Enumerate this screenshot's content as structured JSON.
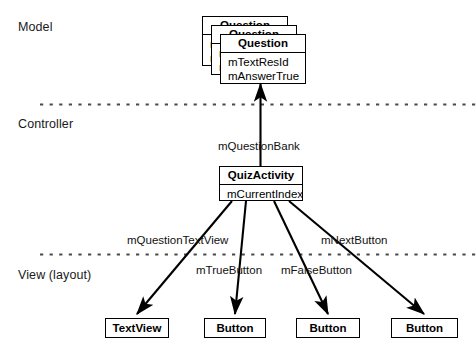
{
  "diagram": {
    "width": 476,
    "height": 347,
    "background": "#ffffff",
    "stroke_color": "#000000",
    "text_color": "#111111"
  },
  "tiers": [
    {
      "id": "model",
      "label": "Model",
      "divider_y": 104
    },
    {
      "id": "controller",
      "label": "Controller",
      "divider_y": 254
    },
    {
      "id": "view",
      "label": "View (layout)"
    }
  ],
  "model": {
    "question_class": {
      "name": "Question",
      "attributes": [
        "mTextResId",
        "mAnswerTrue"
      ],
      "stack_count": 3
    }
  },
  "controller": {
    "quiz_activity": {
      "name": "QuizActivity",
      "attributes": [
        "mCurrentIndex"
      ]
    },
    "association_label": "mQuestionBank"
  },
  "view": {
    "widgets": [
      {
        "id": "textview",
        "label": "TextView",
        "edge_label": "mQuestionTextView"
      },
      {
        "id": "true_button",
        "label": "Button",
        "edge_label": "mTrueButton"
      },
      {
        "id": "false_button",
        "label": "Button",
        "edge_label": "mFalseButton"
      },
      {
        "id": "next_button",
        "label": "Button",
        "edge_label": "mNextButton"
      }
    ]
  },
  "edges": [
    {
      "id": "quizactivity-to-question",
      "from": "QuizActivity",
      "to": "Question",
      "label": "mQuestionBank",
      "arrow": "up"
    },
    {
      "id": "quizactivity-to-textview",
      "from": "QuizActivity",
      "to": "TextView",
      "label": "mQuestionTextView",
      "arrow": "down-left"
    },
    {
      "id": "quizactivity-to-true",
      "from": "QuizActivity",
      "to": "Button",
      "label": "mTrueButton",
      "arrow": "down"
    },
    {
      "id": "quizactivity-to-false",
      "from": "QuizActivity",
      "to": "Button",
      "label": "mFalseButton",
      "arrow": "down"
    },
    {
      "id": "quizactivity-to-next",
      "from": "QuizActivity",
      "to": "Button",
      "label": "mNextButton",
      "arrow": "down-right"
    }
  ]
}
